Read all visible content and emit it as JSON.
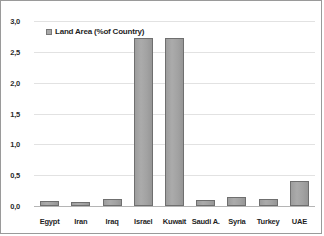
{
  "chart_data": {
    "type": "bar",
    "title": "",
    "xlabel": "",
    "ylabel": "",
    "categories": [
      "Egypt",
      "Iran",
      "Iraq",
      "Israel",
      "Kuwait",
      "Saudi A.",
      "Syria",
      "Turkey",
      "UAE"
    ],
    "series": [
      {
        "name": "Land Area (%of Country)",
        "values": [
          0.08,
          0.06,
          0.11,
          2.72,
          2.72,
          0.1,
          0.15,
          0.11,
          0.41
        ]
      }
    ],
    "ylim": [
      0.0,
      3.0
    ],
    "yticks": [
      0.0,
      0.5,
      1.0,
      1.5,
      2.0,
      2.5,
      3.0
    ],
    "ytick_labels": [
      "0,0",
      "0,5",
      "1,0",
      "1,5",
      "2,0",
      "2,5",
      "3,0"
    ],
    "grid": true,
    "legend": {
      "position": "top-left",
      "entries": [
        {
          "label": "Land Area (%of Country)",
          "color": "#a8a8a8"
        }
      ]
    },
    "colors": {
      "bar_fill": "#a8a8a8",
      "bar_border": "#6f6f6f",
      "gridline": "#e2e2e2",
      "axis": "#b5b5b5",
      "text": "#1f1f1f",
      "background": "#ffffff",
      "frame_border": "#9a9a9a"
    }
  }
}
